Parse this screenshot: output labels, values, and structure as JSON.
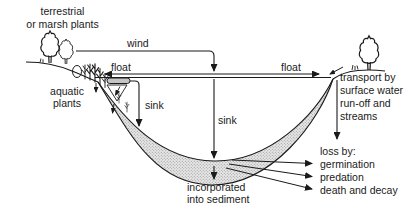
{
  "diagram": {
    "labels": {
      "terrestrial": "terrestrial\nor marsh plants",
      "wind": "wind",
      "float_left": "float",
      "float_right": "float",
      "aquatic_plants": "aquatic\nplants",
      "sink_left": "sink",
      "sink_center": "sink",
      "transport": "transport by\nsurface water\nrun-off and\nstreams",
      "loss_by": "loss by:",
      "loss_germination": "germination",
      "loss_predation": "predation",
      "loss_death_decay": "death and decay",
      "incorporated": "incorporated\ninto sediment"
    },
    "colors": {
      "line": "#1a1a1a",
      "sediment_fill": "#e7e7e7",
      "sediment_dot": "#909090",
      "background": "#ffffff",
      "seed_fill": "#c4c4c4"
    }
  }
}
